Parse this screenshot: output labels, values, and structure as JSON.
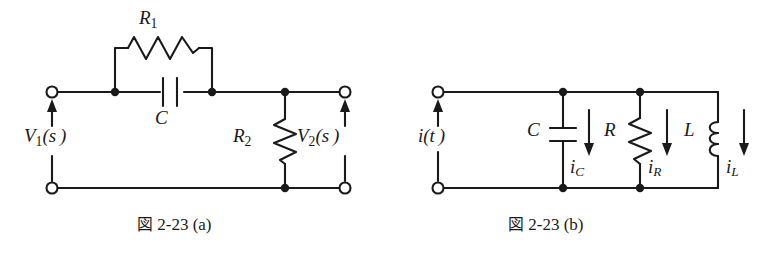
{
  "figure": {
    "background_color": "#ffffff",
    "line_color": "#1a1a1a",
    "panels": [
      {
        "id": "panel-a",
        "caption_prefix": "図",
        "caption_number": "2-23",
        "caption_suffix": "(a)",
        "caption_full": "図 2-23 (a)",
        "description": "Two-port RC network: R1 in parallel with C in the series branch, R2 as shunt element",
        "ports": [
          {
            "name": "input",
            "label": "V",
            "subscript": "1",
            "argument": "(s)",
            "label_full": "V₁(s)",
            "arrow": "up"
          },
          {
            "name": "output",
            "label": "V",
            "subscript": "2",
            "argument": "(s)",
            "label_full": "V₂(s)",
            "arrow": "up"
          }
        ],
        "components": [
          {
            "id": "R1",
            "type": "resistor",
            "label": "R",
            "subscript": "1",
            "label_full": "R₁",
            "orientation": "horizontal",
            "position": "series-top-branch"
          },
          {
            "id": "C",
            "type": "capacitor",
            "label": "C",
            "subscript": "",
            "label_full": "C",
            "orientation": "horizontal",
            "position": "series-main-line"
          },
          {
            "id": "R2",
            "type": "resistor",
            "label": "R",
            "subscript": "2",
            "label_full": "R₂",
            "orientation": "vertical",
            "position": "shunt"
          }
        ],
        "terminals": [
          {
            "id": "in-top",
            "style": "open-circle"
          },
          {
            "id": "in-bottom",
            "style": "open-circle"
          },
          {
            "id": "out-top",
            "style": "open-circle"
          },
          {
            "id": "out-bottom",
            "style": "open-circle"
          }
        ],
        "junction_dots": 5
      },
      {
        "id": "panel-b",
        "caption_prefix": "図",
        "caption_number": "2-23",
        "caption_suffix": "(b)",
        "caption_full": "図 2-23 (b)",
        "description": "Parallel RLC network driven by current source i(t); branch currents iC, iR, iL",
        "source": {
          "label": "i",
          "argument": "(t)",
          "label_full": "i(t)",
          "arrow": "up",
          "type": "current"
        },
        "components": [
          {
            "id": "C",
            "type": "capacitor",
            "label": "C",
            "label_full": "C",
            "orientation": "vertical",
            "current_label": "i",
            "current_subscript": "C",
            "current_label_full": "i_C",
            "current_arrow": "down"
          },
          {
            "id": "R",
            "type": "resistor",
            "label": "R",
            "label_full": "R",
            "orientation": "vertical",
            "current_label": "i",
            "current_subscript": "R",
            "current_label_full": "i_R",
            "current_arrow": "down"
          },
          {
            "id": "L",
            "type": "inductor",
            "label": "L",
            "label_full": "L",
            "orientation": "vertical",
            "current_label": "i",
            "current_subscript": "L",
            "current_label_full": "i_L",
            "current_arrow": "down"
          }
        ],
        "terminals": [
          {
            "id": "src-top",
            "style": "open-circle"
          },
          {
            "id": "src-bottom",
            "style": "open-circle"
          }
        ],
        "junction_dots": 4
      }
    ]
  },
  "labels": {
    "R1_main": "R",
    "R1_sub": "1",
    "C_a": "C",
    "R2_main": "R",
    "R2_sub": "2",
    "V1_main": "V",
    "V1_sub": "1",
    "V1_arg": "(s )",
    "V2_main": "V",
    "V2_sub": "2",
    "V2_arg": "(s )",
    "it_main": "i",
    "it_arg": "(t )",
    "C_b": "C",
    "iC_main": "i",
    "iC_sub": "C",
    "R_b": "R",
    "iR_main": "i",
    "iR_sub": "R",
    "L_b": "L",
    "iL_main": "i",
    "iL_sub": "L"
  },
  "captions": {
    "a_glyph": "図",
    "a_text": " 2-23 (a)",
    "b_glyph": "図",
    "b_text": " 2-23 (b)"
  }
}
